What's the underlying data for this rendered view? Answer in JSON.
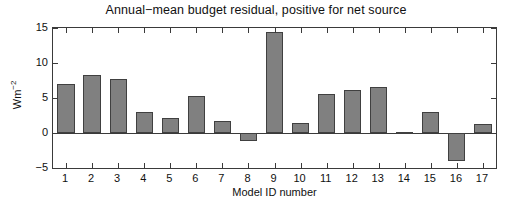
{
  "chart_data": {
    "type": "bar",
    "title": "Annual−mean budget residual, positive for net source",
    "xlabel": "Model ID number",
    "ylabel": "Wm-2",
    "ylabel_base": "Wm",
    "ylabel_exponent": "−2",
    "categories": [
      "1",
      "2",
      "3",
      "4",
      "5",
      "6",
      "7",
      "8",
      "9",
      "10",
      "11",
      "12",
      "13",
      "14",
      "15",
      "16",
      "17"
    ],
    "values": [
      7.0,
      8.3,
      7.7,
      3.0,
      2.1,
      5.3,
      1.7,
      -1.1,
      14.4,
      1.5,
      5.6,
      6.2,
      6.6,
      0.2,
      3.0,
      -4.0,
      1.3
    ],
    "ytick_labels": [
      "15",
      "10",
      "5",
      "0",
      "−5"
    ],
    "ytick_values": [
      15,
      10,
      5,
      0,
      -5
    ],
    "ylim": [
      -5,
      15
    ],
    "xlim": [
      0.5,
      17.5
    ],
    "grid": false,
    "legend": null,
    "bar_color": "#808080",
    "bar_edge_color": "#404040",
    "axis_color": "#3a3a3a",
    "background": "#ffffff"
  }
}
